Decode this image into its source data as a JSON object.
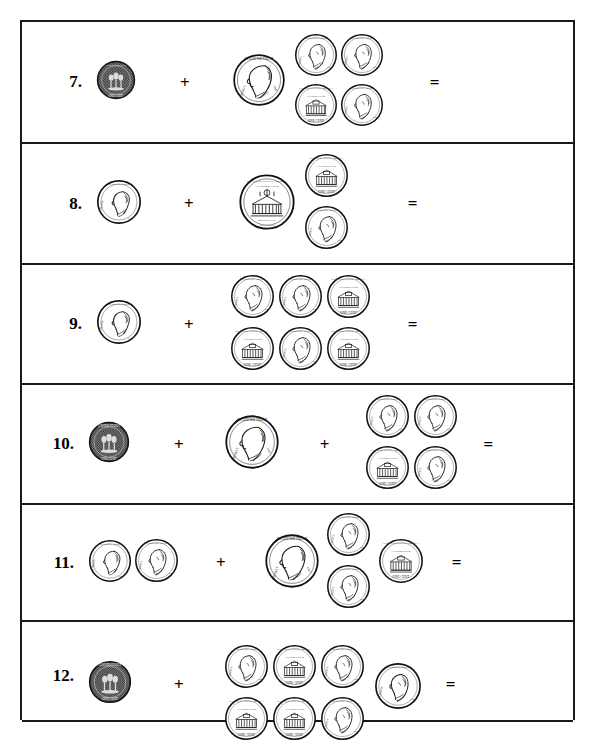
{
  "worksheet": {
    "type": "coin-counting-worksheet",
    "page_border_color": "#1a1a1a",
    "background_color": "#ffffff",
    "plus_symbol": "+",
    "equals_symbol": "=",
    "visible_problem_numbers": [
      "7.",
      "8.",
      "9.",
      "10.",
      "11.",
      "12."
    ],
    "rows": [
      {
        "number": "7.",
        "terms": [
          {
            "coins": [
              {
                "kind": "penny-dark",
                "face": "reverse",
                "label": "dark penny"
              }
            ]
          },
          {
            "coins": [
              {
                "kind": "nickel",
                "face": "obverse",
                "label": "nickel"
              },
              {
                "kind": "penny",
                "face": "obverse",
                "label": "penny"
              },
              {
                "kind": "penny",
                "face": "obverse",
                "label": "penny"
              },
              {
                "kind": "penny",
                "face": "reverse",
                "label": "penny"
              },
              {
                "kind": "penny",
                "face": "obverse",
                "label": "penny"
              }
            ]
          }
        ],
        "operators": [
          "+"
        ],
        "ends_with_equals": true
      },
      {
        "number": "8.",
        "terms": [
          {
            "coins": [
              {
                "kind": "dime",
                "face": "obverse",
                "label": "dime"
              }
            ]
          },
          {
            "coins": [
              {
                "kind": "nickel",
                "face": "reverse",
                "label": "nickel"
              },
              {
                "kind": "penny",
                "face": "reverse",
                "label": "penny"
              },
              {
                "kind": "penny",
                "face": "obverse",
                "label": "penny"
              }
            ]
          }
        ],
        "operators": [
          "+"
        ],
        "ends_with_equals": true
      },
      {
        "number": "9.",
        "terms": [
          {
            "coins": [
              {
                "kind": "dime",
                "face": "obverse",
                "label": "dime"
              }
            ]
          },
          {
            "coins": [
              {
                "kind": "penny",
                "face": "obverse",
                "label": "penny"
              },
              {
                "kind": "penny",
                "face": "obverse",
                "label": "penny"
              },
              {
                "kind": "penny",
                "face": "reverse",
                "label": "penny"
              },
              {
                "kind": "penny",
                "face": "reverse",
                "label": "penny"
              },
              {
                "kind": "penny",
                "face": "obverse",
                "label": "penny"
              },
              {
                "kind": "penny",
                "face": "reverse",
                "label": "penny"
              }
            ]
          }
        ],
        "operators": [
          "+"
        ],
        "ends_with_equals": true
      },
      {
        "number": "10.",
        "terms": [
          {
            "coins": [
              {
                "kind": "penny-dark",
                "face": "reverse",
                "label": "dark penny"
              }
            ]
          },
          {
            "coins": [
              {
                "kind": "nickel",
                "face": "obverse",
                "label": "nickel"
              }
            ]
          },
          {
            "coins": [
              {
                "kind": "penny",
                "face": "obverse",
                "label": "penny"
              },
              {
                "kind": "penny",
                "face": "obverse",
                "label": "penny"
              },
              {
                "kind": "penny",
                "face": "reverse",
                "label": "penny"
              },
              {
                "kind": "penny",
                "face": "obverse",
                "label": "penny"
              }
            ]
          }
        ],
        "operators": [
          "+",
          "+"
        ],
        "ends_with_equals": true
      },
      {
        "number": "11.",
        "terms": [
          {
            "coins": [
              {
                "kind": "dime",
                "face": "obverse",
                "label": "dime"
              },
              {
                "kind": "penny",
                "face": "obverse",
                "label": "penny"
              }
            ]
          },
          {
            "coins": [
              {
                "kind": "nickel",
                "face": "obverse",
                "label": "nickel"
              },
              {
                "kind": "penny",
                "face": "obverse",
                "label": "penny"
              },
              {
                "kind": "penny",
                "face": "obverse",
                "label": "penny"
              },
              {
                "kind": "penny",
                "face": "reverse",
                "label": "penny"
              }
            ]
          }
        ],
        "operators": [
          "+"
        ],
        "ends_with_equals": true
      },
      {
        "number": "12.",
        "terms": [
          {
            "coins": [
              {
                "kind": "penny-dark",
                "face": "reverse",
                "label": "dark penny"
              }
            ]
          },
          {
            "coins": [
              {
                "kind": "penny",
                "face": "obverse",
                "label": "penny"
              },
              {
                "kind": "penny",
                "face": "reverse",
                "label": "penny"
              },
              {
                "kind": "penny",
                "face": "obverse",
                "label": "penny"
              },
              {
                "kind": "penny",
                "face": "obverse",
                "label": "penny"
              },
              {
                "kind": "penny",
                "face": "reverse",
                "label": "penny"
              },
              {
                "kind": "penny",
                "face": "reverse",
                "label": "penny"
              },
              {
                "kind": "penny",
                "face": "obverse",
                "label": "penny"
              }
            ]
          }
        ],
        "operators": [
          "+"
        ],
        "ends_with_equals": true,
        "clipped_at_page_bottom": true
      }
    ]
  }
}
